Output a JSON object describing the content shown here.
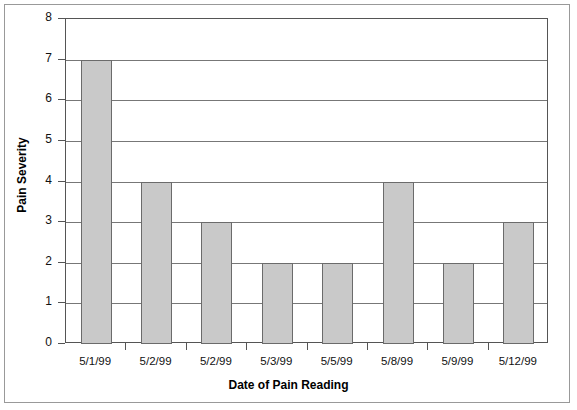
{
  "chart_data": {
    "type": "bar",
    "title": "",
    "xlabel": "Date of Pain Reading",
    "ylabel": "Pain Severity",
    "categories": [
      "5/1/99",
      "5/2/99",
      "5/2/99",
      "5/3/99",
      "5/5/99",
      "5/8/99",
      "5/9/99",
      "5/12/99"
    ],
    "values": [
      7,
      4,
      3,
      2,
      2,
      4,
      2,
      3
    ],
    "ylim": [
      0,
      8
    ],
    "yticks": [
      0,
      1,
      2,
      3,
      4,
      5,
      6,
      7,
      8
    ],
    "ytick_labels": [
      "0",
      "1",
      "2",
      "3",
      "4",
      "5",
      "6",
      "7",
      "8"
    ],
    "grid": true,
    "legend": false,
    "bar_color": "#c9c9c9",
    "bar_border_color": "#6b6b6b",
    "axis_color": "#555555",
    "gridline_color": "#777777",
    "background": "#ffffff"
  }
}
